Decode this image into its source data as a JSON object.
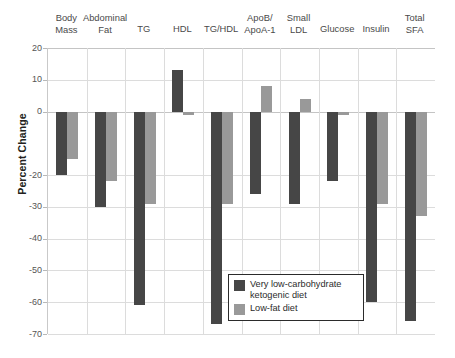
{
  "chart_data": {
    "type": "bar",
    "title": "",
    "xlabel": "",
    "ylabel": "Percent Change",
    "ylim": [
      -70,
      20
    ],
    "yticks": [
      20,
      10,
      0,
      -20,
      -30,
      -40,
      -50,
      -60,
      -70
    ],
    "ytick_labels": [
      "20",
      "10",
      "0",
      "-20",
      "-30",
      "-40",
      "-50",
      "-60",
      "-70"
    ],
    "grid": true,
    "legend_position": "inside-bottom-right",
    "categories": [
      "Body\nMass",
      "Abdominal\nFat",
      "TG",
      "HDL",
      "TG/HDL",
      "ApoB/\nApoA-1",
      "Small\nLDL",
      "Glucose",
      "Insulin",
      "Total\nSFA"
    ],
    "series": [
      {
        "name": "Very low-carbohydrate\nketogenic diet",
        "color": "#464646",
        "values": [
          -20,
          -30,
          -61,
          13,
          -67,
          -26,
          -29,
          -22,
          -60,
          -66
        ]
      },
      {
        "name": "Low-fat diet",
        "color": "#999999",
        "values": [
          -15,
          -22,
          -29,
          -1,
          -29,
          8,
          4,
          -1,
          -29,
          -33
        ]
      }
    ]
  },
  "legend": {
    "items": [
      {
        "label": "Very low-carbohydrate\nketogenic diet",
        "color": "#464646"
      },
      {
        "label": "Low-fat diet",
        "color": "#999999"
      }
    ]
  },
  "axis": {
    "y_title": "Percent Change"
  }
}
